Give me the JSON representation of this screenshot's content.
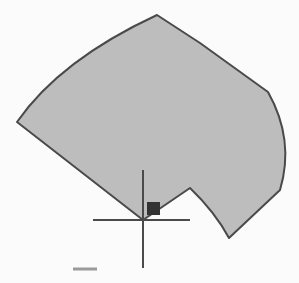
{
  "drawing": {
    "background_color": "#fbfbfb",
    "shape": {
      "type": "polygon-with-arcs",
      "fill_color": "#bdbdbd",
      "stroke_color": "#4a4a4a",
      "path": "M17,122 Q60,60 157,15 L200,43 L268,92 Q295,140 280,190 L229,238 Q215,212 190,188 L143,220 Z"
    },
    "cursor": {
      "type": "crosshair",
      "center": [
        143,
        220
      ],
      "color": "#4a4a4a",
      "vertical_extent": [
        170,
        268
      ],
      "horizontal_extent": [
        93,
        190
      ]
    },
    "pickbox": {
      "x": 147,
      "y": 202,
      "size": 13,
      "color": "#333333"
    },
    "dash_mark": {
      "x1": 73,
      "x2": 97,
      "y": 269,
      "color": "#9a9a9a"
    }
  }
}
